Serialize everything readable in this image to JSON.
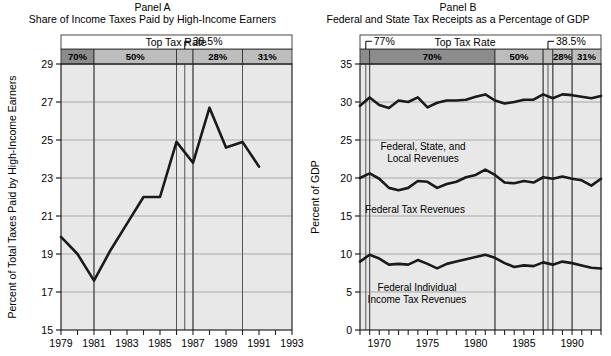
{
  "figure": {
    "background": "#ffffff",
    "plot_background": "#e8e8e8",
    "band_fill_dark": "#8c8c8c",
    "band_fill_light": "#bdbdbd",
    "line_color": "#1a1a1a",
    "grid_color": "#9a9a9a"
  },
  "panelA": {
    "title_line1": "Panel A",
    "title_line2": "Share of Income Taxes Paid by High-Income Earners",
    "ylabel": "Percent of Total Taxes Paid by High-Income Earners",
    "rate_header": "Top Tax Rate",
    "annotation": "38.5%",
    "bands": [
      {
        "label": "70%",
        "start": 1979,
        "end": 1981
      },
      {
        "label": "50%",
        "start": 1981,
        "end": 1986
      },
      {
        "label": "38.5%",
        "start": 1986,
        "end": 1987
      },
      {
        "label": "28%",
        "start": 1987,
        "end": 1990
      },
      {
        "label": "31%",
        "start": 1990,
        "end": 1993
      }
    ],
    "xticklabels": [
      "1979",
      "1981",
      "1983",
      "1985",
      "1987",
      "1989",
      "1991",
      "1993"
    ],
    "yticklabels": [
      "15",
      "17",
      "19",
      "21",
      "23",
      "25",
      "27",
      "29"
    ]
  },
  "panelB": {
    "title_line1": "Panel B",
    "title_line2": "Federal and State Tax Receipts as a Percentage of GDP",
    "ylabel": "Percent of GDP",
    "rate_header": "Top Tax Rate",
    "annotation_left": "77%",
    "annotation_right": "38.5%",
    "bands": [
      {
        "label": "77%",
        "start": 1968,
        "end": 1969
      },
      {
        "label": "70%",
        "start": 1969,
        "end": 1982
      },
      {
        "label": "50%",
        "start": 1982,
        "end": 1987
      },
      {
        "label": "38.5%",
        "start": 1987,
        "end": 1988
      },
      {
        "label": "28%",
        "start": 1988,
        "end": 1990
      },
      {
        "label": "31%",
        "start": 1990,
        "end": 1993
      }
    ],
    "xticklabels": [
      "1970",
      "1975",
      "1980",
      "1985",
      "1990"
    ],
    "yticklabels": [
      "0",
      "5",
      "10",
      "15",
      "20",
      "25",
      "30",
      "35"
    ],
    "series_labels": {
      "top": "Federal, State, and\nLocal Revenues",
      "top_l1": "Federal, State, and",
      "top_l2": "Local Revenues",
      "mid": "Federal Tax Revenues",
      "bot_l1": "Federal Individual",
      "bot_l2": "Income Tax Revenues"
    }
  },
  "chart_data": [
    {
      "type": "line",
      "panel": "Panel A",
      "title": "Share of Income Taxes Paid by High-Income Earners",
      "xlabel": "",
      "ylabel": "Percent of Total Taxes Paid by High-Income Earners",
      "xlim": [
        1979,
        1993
      ],
      "ylim": [
        15,
        29
      ],
      "yticks": [
        15,
        17,
        19,
        21,
        23,
        25,
        27,
        29
      ],
      "xticks": [
        1979,
        1980,
        1981,
        1982,
        1983,
        1984,
        1985,
        1986,
        1987,
        1988,
        1989,
        1990,
        1991,
        1992,
        1993
      ],
      "xticklabels_shown": [
        1979,
        1981,
        1983,
        1985,
        1987,
        1989,
        1991
      ],
      "grid": true,
      "legend": "none",
      "series": [
        {
          "name": "Share of income taxes paid by high-income earners",
          "x": [
            1979,
            1980,
            1981,
            1982,
            1983,
            1984,
            1985,
            1986,
            1987,
            1988,
            1989,
            1990,
            1991
          ],
          "values": [
            19.9,
            19.0,
            17.6,
            19.2,
            20.6,
            22.0,
            22.0,
            24.9,
            23.8,
            26.7,
            24.6,
            24.9,
            23.6
          ]
        }
      ],
      "annotations": [
        {
          "text": "Top Tax Rate",
          "kind": "band-header"
        },
        {
          "text": "38.5%",
          "kind": "callout",
          "x": 1986.5
        },
        {
          "text": "70%",
          "kind": "band",
          "x_range": [
            1979,
            1981
          ]
        },
        {
          "text": "50%",
          "kind": "band",
          "x_range": [
            1981,
            1986
          ]
        },
        {
          "text": "28%",
          "kind": "band",
          "x_range": [
            1987,
            1990
          ]
        },
        {
          "text": "31%",
          "kind": "band",
          "x_range": [
            1990,
            1993
          ]
        }
      ]
    },
    {
      "type": "line",
      "panel": "Panel B",
      "title": "Federal and State Tax Receipts as a Percentage of GDP",
      "xlabel": "",
      "ylabel": "Percent of GDP",
      "xlim": [
        1968,
        1993
      ],
      "ylim": [
        0,
        35
      ],
      "yticks": [
        0,
        5,
        10,
        15,
        20,
        25,
        30,
        35
      ],
      "xticklabels_shown": [
        1970,
        1975,
        1980,
        1985,
        1990
      ],
      "grid": true,
      "legend": "inline-labels",
      "x": [
        1968,
        1969,
        1970,
        1971,
        1972,
        1973,
        1974,
        1975,
        1976,
        1977,
        1978,
        1979,
        1980,
        1981,
        1982,
        1983,
        1984,
        1985,
        1986,
        1987,
        1988,
        1989,
        1990,
        1991,
        1992,
        1993
      ],
      "series": [
        {
          "name": "Federal, State, and Local Revenues",
          "values": [
            29.5,
            30.6,
            29.6,
            29.2,
            30.2,
            30.0,
            30.6,
            29.3,
            29.9,
            30.2,
            30.2,
            30.3,
            30.7,
            31.0,
            30.2,
            29.8,
            30.0,
            30.3,
            30.3,
            31.0,
            30.5,
            31.0,
            30.9,
            30.7,
            30.5,
            30.8
          ]
        },
        {
          "name": "Federal Tax Revenues",
          "values": [
            20.0,
            20.6,
            19.9,
            18.7,
            18.4,
            18.7,
            19.6,
            19.5,
            18.7,
            19.2,
            19.5,
            20.1,
            20.4,
            21.1,
            20.4,
            19.4,
            19.3,
            19.6,
            19.4,
            20.1,
            19.9,
            20.2,
            19.9,
            19.7,
            19.0,
            19.9
          ]
        },
        {
          "name": "Federal Individual Income Tax Revenues",
          "values": [
            9.0,
            9.9,
            9.4,
            8.6,
            8.7,
            8.6,
            9.2,
            8.7,
            8.1,
            8.7,
            9.0,
            9.3,
            9.6,
            9.9,
            9.5,
            8.8,
            8.3,
            8.5,
            8.4,
            8.9,
            8.6,
            9.0,
            8.8,
            8.5,
            8.2,
            8.1
          ]
        }
      ],
      "annotations": [
        {
          "text": "Top Tax Rate",
          "kind": "band-header"
        },
        {
          "text": "77%",
          "kind": "callout",
          "x": 1968.5
        },
        {
          "text": "38.5%",
          "kind": "callout",
          "x": 1987.5
        },
        {
          "text": "70%",
          "kind": "band",
          "x_range": [
            1969,
            1982
          ]
        },
        {
          "text": "50%",
          "kind": "band",
          "x_range": [
            1982,
            1987
          ]
        },
        {
          "text": "28%",
          "kind": "band",
          "x_range": [
            1988,
            1990
          ]
        },
        {
          "text": "31%",
          "kind": "band",
          "x_range": [
            1990,
            1993
          ]
        }
      ]
    }
  ]
}
